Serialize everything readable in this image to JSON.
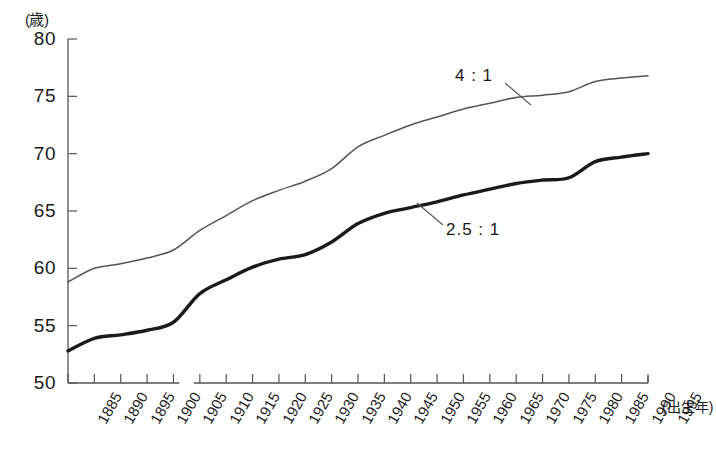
{
  "chart_data": {
    "type": "line",
    "title": "",
    "subtitle": "",
    "xlabel": "(出生年)",
    "ylabel": "(歳)",
    "y_unit": "(歳)",
    "x_unit": "(出生年)",
    "xlim": [
      1885,
      1995
    ],
    "ylim": [
      50,
      80
    ],
    "y_ticks": [
      50,
      55,
      60,
      65,
      70,
      75,
      80
    ],
    "x_ticks": [
      1885,
      1890,
      1895,
      1900,
      1905,
      1910,
      1915,
      1920,
      1925,
      1930,
      1935,
      1940,
      1945,
      1950,
      1955,
      1960,
      1965,
      1970,
      1975,
      1980,
      1985,
      1990,
      1995
    ],
    "grid": false,
    "legend_position": "inline-annotation",
    "x": [
      1885,
      1890,
      1895,
      1900,
      1905,
      1910,
      1915,
      1920,
      1925,
      1930,
      1935,
      1940,
      1945,
      1950,
      1955,
      1960,
      1965,
      1970,
      1975,
      1980,
      1985,
      1990,
      1995
    ],
    "series": [
      {
        "name": "4 : 1",
        "label": "4 : 1",
        "style": "thin",
        "color": "#555555",
        "values": [
          58.8,
          60.0,
          60.4,
          60.9,
          61.6,
          63.3,
          64.6,
          65.9,
          66.8,
          67.6,
          68.7,
          70.6,
          71.6,
          72.5,
          73.2,
          73.9,
          74.4,
          74.9,
          75.1,
          75.4,
          76.3,
          76.6,
          76.8
        ]
      },
      {
        "name": "2.5 : 1",
        "label": "2.5 : 1",
        "style": "thick",
        "color": "#1a1a1a",
        "values": [
          52.8,
          53.9,
          54.2,
          54.6,
          55.3,
          57.8,
          59.0,
          60.1,
          60.8,
          61.2,
          62.3,
          63.9,
          64.8,
          65.3,
          65.8,
          66.4,
          66.9,
          67.4,
          67.7,
          67.9,
          69.3,
          69.7,
          70.0
        ]
      }
    ],
    "annotations": [
      {
        "text": "4 : 1",
        "series": "4 : 1"
      },
      {
        "text": "2.5 : 1",
        "series": "2.5 : 1"
      }
    ],
    "axis_break": {
      "between": [
        1905,
        1910
      ]
    }
  }
}
